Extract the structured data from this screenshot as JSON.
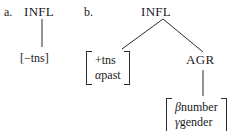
{
  "figure": {
    "background": "#ffffff",
    "ink": "#2b2b2b"
  },
  "items": [
    {
      "label": "a.",
      "root": "INFL",
      "leaf_simple": "[−tns]"
    },
    {
      "label": "b.",
      "root": "INFL",
      "left_matrix": {
        "row1": "+tns",
        "row2_greek": "α",
        "row2_text": "past"
      },
      "right_node": "AGR",
      "right_matrix": {
        "row1_greek": "β",
        "row1_text": "number",
        "row2_greek": "γ",
        "row2_text": "gender"
      }
    }
  ]
}
